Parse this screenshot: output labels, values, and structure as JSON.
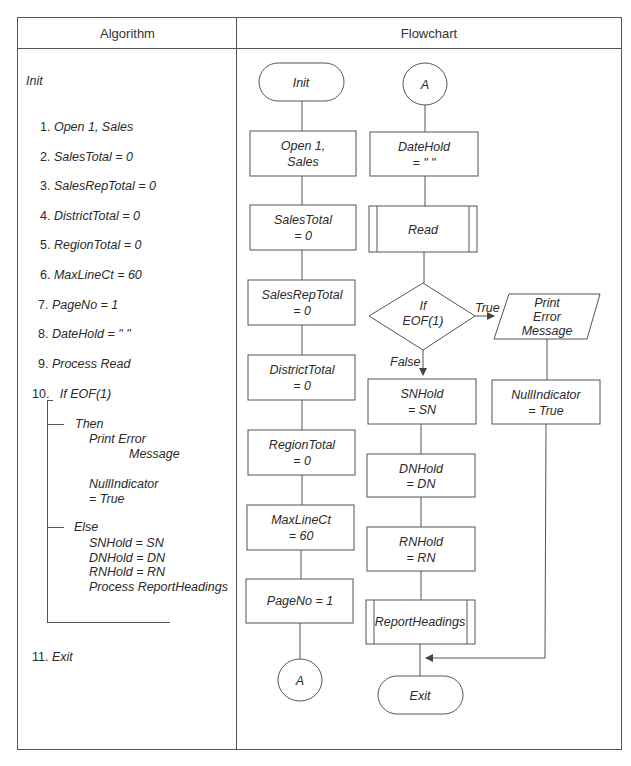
{
  "headers": {
    "algorithm": "Algorithm",
    "flowchart": "Flowchart"
  },
  "algorithm": {
    "title": "Init",
    "steps": [
      {
        "num": "1.",
        "text": "Open 1, Sales"
      },
      {
        "num": "2.",
        "text": "SalesTotal = 0"
      },
      {
        "num": "3.",
        "text": "SalesRepTotal = 0"
      },
      {
        "num": "4.",
        "text": "DistrictTotal = 0"
      },
      {
        "num": "5.",
        "text": "RegionTotal = 0"
      },
      {
        "num": "6.",
        "text": "MaxLineCt = 60"
      },
      {
        "num": "7.",
        "text": "PageNo = 1"
      },
      {
        "num": "8.",
        "text": "DateHold = \" \""
      },
      {
        "num": "9.",
        "text": "Process Read"
      },
      {
        "num": "10.",
        "text": "If EOF(1)"
      },
      {
        "num": "11.",
        "text": "Exit"
      }
    ],
    "then_label": "Then",
    "then_lines": [
      "Print Error",
      "Message",
      "NullIndicator",
      "= True"
    ],
    "else_label": "Else",
    "else_lines": [
      "SNHold = SN",
      "DNHold = DN",
      "RNHold = RN",
      "Process ReportHeadings"
    ]
  },
  "flowchart": {
    "left_column": {
      "start": "Init",
      "boxes": [
        [
          "Open 1,",
          "Sales"
        ],
        [
          "SalesTotal",
          "= 0"
        ],
        [
          "SalesRepTotal",
          "= 0"
        ],
        [
          "DistrictTotal",
          "= 0"
        ],
        [
          "RegionTotal",
          "= 0"
        ],
        [
          "MaxLineCt",
          "= 60"
        ],
        [
          "PageNo = 1"
        ]
      ],
      "connector": "A"
    },
    "right_column": {
      "connector": "A",
      "datehold": [
        "DateHold",
        "= \" \""
      ],
      "read": "Read",
      "decision": [
        "If",
        "EOF(1)"
      ],
      "true_label": "True",
      "false_label": "False",
      "print": [
        "Print",
        "Error",
        "Message"
      ],
      "null_indicator": [
        "NullIndicator",
        "= True"
      ],
      "snhold": [
        "SNHold",
        "= SN"
      ],
      "dnhold": [
        "DNHold",
        "= DN"
      ],
      "rnhold": [
        "RNHold",
        "= RN"
      ],
      "report_headings": "ReportHeadings",
      "end": "Exit"
    }
  }
}
